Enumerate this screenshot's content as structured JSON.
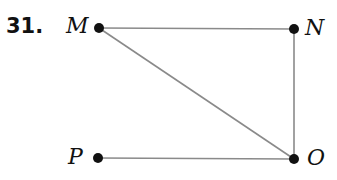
{
  "problem": {
    "number": "31."
  },
  "points": [
    {
      "id": "M",
      "label": "M",
      "x": 99,
      "y": 28
    },
    {
      "id": "N",
      "label": "N",
      "x": 294,
      "y": 29
    },
    {
      "id": "P",
      "label": "P",
      "x": 98,
      "y": 158
    },
    {
      "id": "O",
      "label": "O",
      "x": 294,
      "y": 159
    }
  ],
  "segments": [
    {
      "from": "M",
      "to": "N"
    },
    {
      "from": "N",
      "to": "O"
    },
    {
      "from": "M",
      "to": "O"
    },
    {
      "from": "P",
      "to": "O"
    }
  ],
  "colors": {
    "line": "#8a8a8a",
    "point": "#111111"
  }
}
